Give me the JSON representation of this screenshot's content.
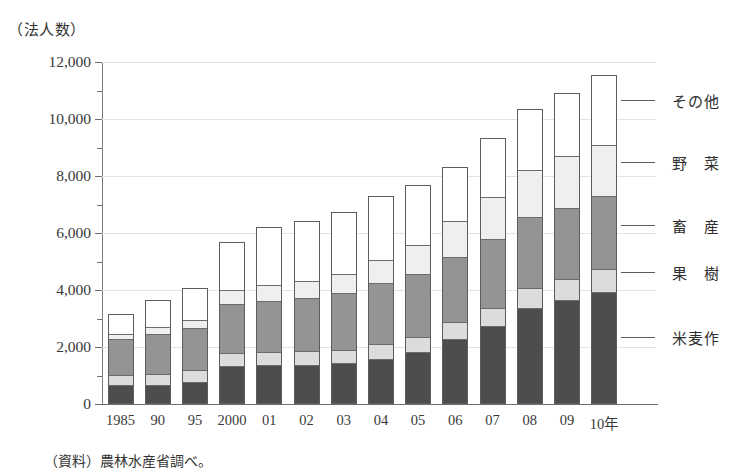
{
  "unit_caption": "（法人数）",
  "source_note": "（資料）農林水産省調べ。",
  "colors": {
    "rice": "#4d4d4d",
    "fruit": "#dcdcdc",
    "livestock": "#949494",
    "vegetable": "#efefef",
    "other": "#ffffff",
    "axis": "#6e6e6e",
    "grid": "#e2e2e2"
  },
  "legend": [
    {
      "key": "other",
      "label": "その他"
    },
    {
      "key": "vegetable",
      "label": "野　菜"
    },
    {
      "key": "livestock",
      "label": "畜　産"
    },
    {
      "key": "fruit",
      "label": "果　樹"
    },
    {
      "key": "rice",
      "label": "米麦作"
    }
  ],
  "yaxis": {
    "labels": [
      "12,000",
      "10,000",
      "8,000",
      "6,000",
      "4,000",
      "2,000",
      "0"
    ],
    "major_step": 2000,
    "minor_step": 1000,
    "min": 0,
    "max": 12000
  },
  "chart_data": {
    "type": "bar",
    "title": "（法人数）",
    "xlabel": "",
    "ylabel": "法人数",
    "ylim": [
      0,
      12000
    ],
    "grid": true,
    "stacked": true,
    "legend_position": "right",
    "categories": [
      "1985",
      "90",
      "95",
      "2000",
      "01",
      "02",
      "03",
      "04",
      "05",
      "06",
      "07",
      "08",
      "09",
      "10年"
    ],
    "series": [
      {
        "name": "米麦作",
        "values": [
          600,
          620,
          730,
          1270,
          1300,
          1330,
          1380,
          1530,
          1770,
          2230,
          2680,
          3330,
          3620,
          3900
        ]
      },
      {
        "name": "果樹",
        "values": [
          360,
          400,
          410,
          480,
          470,
          470,
          480,
          510,
          540,
          590,
          630,
          690,
          740,
          790
        ]
      },
      {
        "name": "畜産",
        "values": [
          1320,
          1420,
          1520,
          1740,
          1830,
          1900,
          1990,
          2180,
          2240,
          2320,
          2450,
          2510,
          2500,
          2590
        ]
      },
      {
        "name": "野菜",
        "values": [
          170,
          260,
          280,
          480,
          540,
          600,
          680,
          820,
          1000,
          1280,
          1480,
          1680,
          1820,
          1790
        ]
      },
      {
        "name": "その他",
        "values": [
          700,
          960,
          1130,
          1700,
          2070,
          2130,
          2220,
          2270,
          2140,
          1910,
          2080,
          2140,
          2240,
          2470
        ]
      }
    ],
    "totals": [
      3150,
      3660,
      4070,
      5670,
      6210,
      6430,
      6750,
      7310,
      7690,
      8330,
      9320,
      10350,
      10920,
      11540
    ],
    "source": "（資料）農林水産省調べ。"
  }
}
